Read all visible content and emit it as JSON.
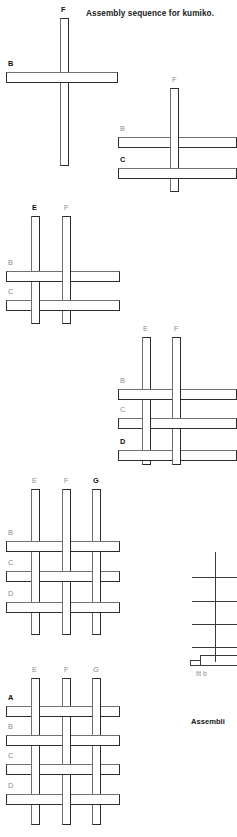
{
  "page": {
    "width": 237,
    "height": 837,
    "background": "#ffffff",
    "stroke_dark": "#2b2b2b",
    "stroke_light": "#6f6f6f",
    "label_old_color": "#8a8a8a",
    "label_new_color": "#111111"
  },
  "title": {
    "text": "Assembly sequence for kumiko.",
    "x": 86,
    "y": 9
  },
  "bottom_caption": {
    "text": "Assembli",
    "x": 191,
    "y": 717
  },
  "fit_note": {
    "text": "fit b",
    "x": 196,
    "y": 670
  },
  "steps": [
    {
      "id": "step-1",
      "verticals": [
        {
          "label": "F",
          "state": "new",
          "x": 60,
          "y": 18,
          "w": 9,
          "h": 148,
          "label_x": 61,
          "label_y": 6
        }
      ],
      "horizontals": [
        {
          "label": "B",
          "state": "new",
          "x": 6,
          "y": 72,
          "w": 112,
          "h": 11,
          "label_x": 8,
          "label_y": 60,
          "over": [
            "F"
          ]
        }
      ],
      "order": [
        "F-over-B-partial"
      ]
    },
    {
      "id": "step-2",
      "verticals": [
        {
          "label": "F",
          "state": "old",
          "x": 170,
          "y": 88,
          "w": 9,
          "h": 104,
          "label_x": 172,
          "label_y": 76
        }
      ],
      "horizontals": [
        {
          "label": "B",
          "state": "old",
          "x": 118,
          "y": 137,
          "w": 119,
          "h": 11,
          "label_x": 120,
          "label_y": 125,
          "over": []
        },
        {
          "label": "C",
          "state": "new",
          "x": 118,
          "y": 168,
          "w": 119,
          "h": 11,
          "label_x": 120,
          "label_y": 156,
          "over": [
            "F"
          ]
        }
      ]
    },
    {
      "id": "step-3",
      "verticals": [
        {
          "label": "E",
          "state": "new",
          "x": 31,
          "y": 216,
          "w": 9,
          "h": 108,
          "label_x": 32,
          "label_y": 204
        },
        {
          "label": "F",
          "state": "old",
          "x": 62,
          "y": 216,
          "w": 9,
          "h": 108,
          "label_x": 64,
          "label_y": 204
        }
      ],
      "horizontals": [
        {
          "label": "B",
          "state": "old",
          "x": 6,
          "y": 271,
          "w": 114,
          "h": 11,
          "label_x": 8,
          "label_y": 259,
          "over": [
            "E"
          ]
        },
        {
          "label": "C",
          "state": "old",
          "x": 6,
          "y": 300,
          "w": 114,
          "h": 11,
          "label_x": 8,
          "label_y": 288,
          "over": [
            "F"
          ]
        }
      ]
    },
    {
      "id": "step-4",
      "verticals": [
        {
          "label": "E",
          "state": "old",
          "x": 142,
          "y": 337,
          "w": 9,
          "h": 128,
          "label_x": 143,
          "label_y": 325
        },
        {
          "label": "F",
          "state": "old",
          "x": 172,
          "y": 337,
          "w": 9,
          "h": 128,
          "label_x": 174,
          "label_y": 325
        }
      ],
      "horizontals": [
        {
          "label": "B",
          "state": "old",
          "x": 118,
          "y": 389,
          "w": 119,
          "h": 11,
          "label_x": 120,
          "label_y": 377,
          "over": [
            "E"
          ]
        },
        {
          "label": "C",
          "state": "old",
          "x": 118,
          "y": 418,
          "w": 119,
          "h": 11,
          "label_x": 120,
          "label_y": 406,
          "over": [
            "F"
          ]
        },
        {
          "label": "D",
          "state": "new",
          "x": 118,
          "y": 450,
          "w": 119,
          "h": 11,
          "label_x": 120,
          "label_y": 438,
          "over": [
            "E"
          ]
        }
      ]
    },
    {
      "id": "step-5",
      "verticals": [
        {
          "label": "E",
          "state": "old",
          "x": 31,
          "y": 489,
          "w": 9,
          "h": 146,
          "label_x": 32,
          "label_y": 477
        },
        {
          "label": "F",
          "state": "old",
          "x": 62,
          "y": 489,
          "w": 9,
          "h": 146,
          "label_x": 64,
          "label_y": 477
        },
        {
          "label": "G",
          "state": "new",
          "x": 92,
          "y": 489,
          "w": 9,
          "h": 146,
          "label_x": 93,
          "label_y": 477
        }
      ],
      "horizontals": [
        {
          "label": "B",
          "state": "old",
          "x": 6,
          "y": 541,
          "w": 114,
          "h": 11,
          "label_x": 8,
          "label_y": 529,
          "over": [
            "E",
            "G"
          ]
        },
        {
          "label": "C",
          "state": "old",
          "x": 6,
          "y": 571,
          "w": 114,
          "h": 11,
          "label_x": 8,
          "label_y": 559,
          "over": [
            "F"
          ]
        },
        {
          "label": "D",
          "state": "old",
          "x": 6,
          "y": 602,
          "w": 114,
          "h": 11,
          "label_x": 8,
          "label_y": 590,
          "over": [
            "E",
            "G"
          ]
        }
      ]
    },
    {
      "id": "step-6",
      "verticals": [
        {
          "label": "E",
          "state": "old",
          "x": 31,
          "y": 678,
          "w": 9,
          "h": 147,
          "label_x": 32,
          "label_y": 666
        },
        {
          "label": "F",
          "state": "old",
          "x": 62,
          "y": 678,
          "w": 9,
          "h": 147,
          "label_x": 64,
          "label_y": 666
        },
        {
          "label": "G",
          "state": "old",
          "x": 92,
          "y": 678,
          "w": 9,
          "h": 147,
          "label_x": 93,
          "label_y": 666
        }
      ],
      "horizontals": [
        {
          "label": "A",
          "state": "new",
          "x": 6,
          "y": 706,
          "w": 114,
          "h": 11,
          "label_x": 8,
          "label_y": 694,
          "over": [
            "F"
          ]
        },
        {
          "label": "B",
          "state": "old",
          "x": 6,
          "y": 735,
          "w": 114,
          "h": 11,
          "label_x": 8,
          "label_y": 723,
          "over": [
            "E",
            "G"
          ]
        },
        {
          "label": "C",
          "state": "old",
          "x": 6,
          "y": 764,
          "w": 114,
          "h": 11,
          "label_x": 8,
          "label_y": 752,
          "over": [
            "F"
          ]
        },
        {
          "label": "D",
          "state": "old",
          "x": 6,
          "y": 794,
          "w": 114,
          "h": 11,
          "label_x": 8,
          "label_y": 782,
          "over": [
            "E",
            "G"
          ]
        }
      ]
    }
  ],
  "detail_schematic": {
    "id": "joint-detail",
    "vertical": {
      "x": 215,
      "y": 552,
      "h": 110
    },
    "crossbars": [
      {
        "y": 577,
        "x": 192,
        "w": 45
      },
      {
        "y": 601,
        "x": 192,
        "w": 45
      },
      {
        "y": 624,
        "x": 192,
        "w": 45
      },
      {
        "y": 647,
        "x": 192,
        "w": 45
      }
    ],
    "step_base": {
      "x": 190,
      "y": 655,
      "w": 47,
      "h": 10
    }
  }
}
